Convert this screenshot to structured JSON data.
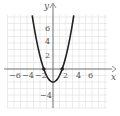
{
  "chart_data": {
    "type": "line",
    "title": "",
    "xlabel": "x",
    "ylabel": "y",
    "xlim": [
      -7,
      8
    ],
    "ylim": [
      -6,
      8.3
    ],
    "grid": true,
    "x_ticks": [
      -6,
      -4,
      -2,
      2,
      4,
      6
    ],
    "x_tick_labels": [
      "−6",
      "−4",
      "−2",
      "2",
      "4",
      "6"
    ],
    "y_ticks": [
      2,
      4,
      6,
      -4
    ],
    "y_tick_labels": [
      "2",
      "4",
      "6",
      "−4"
    ],
    "series": [
      {
        "name": "y = x^2 - 2",
        "equation": "y = x^2 - 2",
        "x": [
          -3.2,
          -3,
          -2.5,
          -2,
          -1.5,
          -1,
          -0.5,
          0,
          0.5,
          1,
          1.5,
          2,
          2.5,
          3,
          3.2
        ],
        "y": [
          8.24,
          7,
          4.25,
          2,
          0.25,
          -1,
          -1.75,
          -2,
          -1.75,
          -1,
          0.25,
          2,
          4.25,
          7,
          8.24
        ]
      }
    ],
    "marked_points": [
      {
        "x": -1.41,
        "y": 0
      },
      {
        "x": 1.41,
        "y": 0
      }
    ],
    "colors": {
      "curve": "#222222",
      "axes": "#777777",
      "grid": "#e2e2e2",
      "text": "#555555"
    }
  },
  "labels": {
    "x_axis": "x",
    "y_axis": "y",
    "xt0": "−6",
    "xt1": "−4",
    "xt2": "−2",
    "xt3": "2",
    "xt4": "4",
    "xt5": "6",
    "yt0": "6",
    "yt1": "4",
    "yt2": "2",
    "yt3": "−4"
  }
}
